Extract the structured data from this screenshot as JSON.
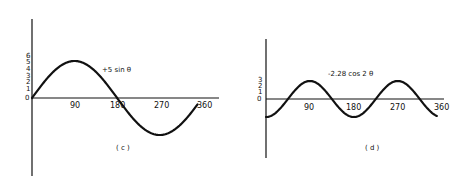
{
  "chart_data": [
    {
      "type": "line",
      "panel_label": "( c )",
      "series": [
        {
          "name": "+5 sin θ",
          "x": [
            0,
            30,
            60,
            90,
            120,
            150,
            180,
            210,
            240,
            270,
            300,
            330,
            350
          ],
          "values": [
            0,
            2.5,
            4.33,
            5,
            4.33,
            2.5,
            0,
            -2.5,
            -4.33,
            -5,
            -4.33,
            -2.5,
            -0.87
          ]
        }
      ],
      "annotation": "+5 sin θ",
      "x_ticks": [
        "90",
        "180",
        "270",
        "360"
      ],
      "y_ticks": [
        "0",
        "1",
        "2",
        "3",
        "4",
        "5",
        "6"
      ],
      "xlabel": "",
      "ylabel": "",
      "xlim": [
        0,
        380
      ],
      "ylim": [
        -13,
        10
      ],
      "grid": false
    },
    {
      "type": "line",
      "panel_label": "( d )",
      "series": [
        {
          "name": "-2.28 cos 2θ",
          "x": [
            0,
            45,
            90,
            135,
            180,
            225,
            270,
            315,
            350
          ],
          "values": [
            -2.28,
            0,
            2.28,
            0,
            -2.28,
            0,
            2.28,
            0,
            -2.14
          ]
        }
      ],
      "annotation": "-2.28 cos 2 θ",
      "x_ticks": [
        "90",
        "180",
        "270",
        "360"
      ],
      "y_ticks": [
        "0",
        "1",
        "2",
        "3"
      ],
      "xlabel": "",
      "ylabel": "",
      "xlim": [
        0,
        375
      ],
      "ylim": [
        -7.5,
        7.5
      ],
      "grid": false
    }
  ],
  "labels": {
    "c": {
      "caption": "( c )",
      "annotation": "+5 sin θ",
      "x_ticks": [
        "90",
        "180",
        "270",
        "360"
      ],
      "y_ticks": [
        "6",
        "5",
        "4",
        "3",
        "2",
        "1",
        "0"
      ]
    },
    "d": {
      "caption": "( d )",
      "annotation": "-2.28 cos 2 θ",
      "x_ticks": [
        "90",
        "180",
        "270",
        "360"
      ],
      "y_ticks": [
        "3",
        "2",
        "1",
        "0"
      ]
    }
  }
}
